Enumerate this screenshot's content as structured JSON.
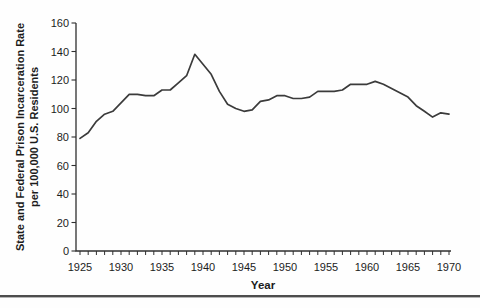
{
  "page": {
    "background": "#ffffff",
    "divider_color": "#4d4d4d"
  },
  "chart_data": {
    "type": "line",
    "xlabel": "Year",
    "ylabel_line1": "State and Federal Prison Incarceration Rate",
    "ylabel_line2": "per 100,000 U.S. Residents",
    "x": [
      1925,
      1926,
      1927,
      1928,
      1929,
      1930,
      1931,
      1932,
      1933,
      1934,
      1935,
      1936,
      1937,
      1938,
      1939,
      1940,
      1941,
      1942,
      1943,
      1944,
      1945,
      1946,
      1947,
      1948,
      1949,
      1950,
      1951,
      1952,
      1953,
      1954,
      1955,
      1956,
      1957,
      1958,
      1959,
      1960,
      1961,
      1962,
      1963,
      1964,
      1965,
      1966,
      1967,
      1968,
      1969,
      1970
    ],
    "values": [
      79,
      83,
      91,
      96,
      98,
      104,
      110,
      110,
      109,
      109,
      113,
      113,
      118,
      123,
      138,
      131,
      124,
      112,
      103,
      100,
      98,
      99,
      105,
      106,
      109,
      109,
      107,
      107,
      108,
      112,
      112,
      112,
      113,
      117,
      117,
      117,
      119,
      117,
      114,
      111,
      108,
      102,
      98,
      94,
      97,
      96
    ],
    "xlim": [
      1925,
      1970
    ],
    "ylim": [
      0,
      160
    ],
    "yticks": [
      0,
      20,
      40,
      60,
      80,
      100,
      120,
      140,
      160
    ],
    "xticks": [
      1925,
      1930,
      1935,
      1940,
      1945,
      1950,
      1955,
      1960,
      1965,
      1970
    ],
    "xtick_minor_interval": 1,
    "grid": false,
    "legend": "none",
    "line_color": "#3b3b3b",
    "axis_color": "#2f2f2f",
    "label_color": "#1c1c1c"
  }
}
